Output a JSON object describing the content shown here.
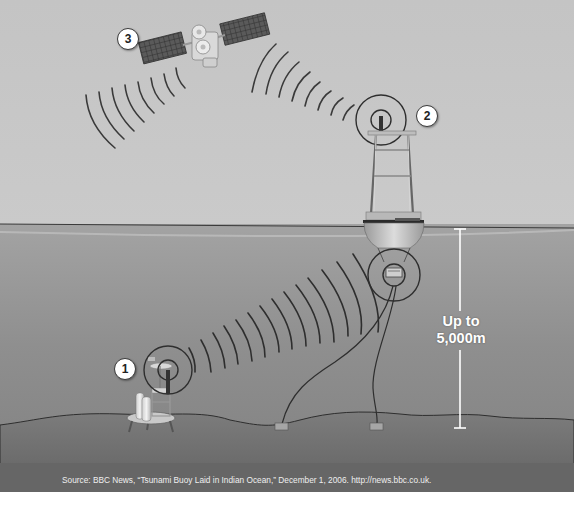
{
  "diagram": {
    "components": [
      {
        "id": 1,
        "label": "1",
        "name": "Seabed pressure sensor"
      },
      {
        "id": 2,
        "label": "2",
        "name": "Surface buoy"
      },
      {
        "id": 3,
        "label": "3",
        "name": "Satellite"
      }
    ],
    "depth": {
      "line1": "Up to",
      "line2": "5,000m"
    },
    "source": "Source: BBC News, “Tsunami Buoy Laid in Indian Ocean,” December 1, 2006. http://news.bbc.co.uk."
  },
  "colors": {
    "sky": "#c6c6c6",
    "sea": "#8e8e8e",
    "seabed": "#7a7a7a",
    "footer": "#666666",
    "line": "#2e2e2e"
  }
}
